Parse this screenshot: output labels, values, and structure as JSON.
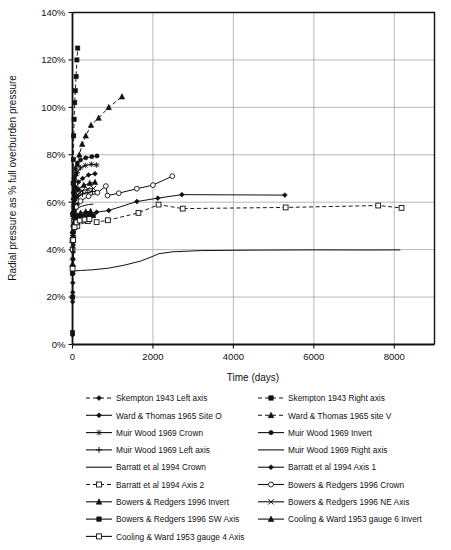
{
  "chart_data": {
    "type": "line",
    "title": "",
    "xlabel": "Time (days)",
    "ylabel": "Radial pressure as % full overburden pressure",
    "xlim": [
      0,
      9000
    ],
    "ylim": [
      0,
      1.4
    ],
    "xticks": [
      0,
      2000,
      4000,
      6000,
      8000
    ],
    "xtick_labels": [
      "0",
      "2000",
      "4000",
      "6000",
      "8000"
    ],
    "yticks": [
      0,
      0.2,
      0.4,
      0.6,
      0.8,
      1.0,
      1.2,
      1.4
    ],
    "ytick_labels": [
      "0%",
      "20%",
      "40%",
      "60%",
      "80%",
      "100%",
      "120%",
      "140%"
    ],
    "grid": "horizontal-and-vertical",
    "legend_position": "below-plot",
    "series": [
      {
        "name": "Skempton 1943 Left axis",
        "marker": "diamond",
        "linestyle": "dashed",
        "points": [
          [
            2,
            0.04
          ],
          [
            4,
            0.18
          ],
          [
            6,
            0.22
          ],
          [
            8,
            0.26
          ],
          [
            10,
            0.3
          ],
          [
            12,
            0.33
          ],
          [
            14,
            0.36
          ],
          [
            16,
            0.39
          ],
          [
            18,
            0.42
          ],
          [
            20,
            0.44
          ],
          [
            24,
            0.47
          ],
          [
            28,
            0.5
          ],
          [
            32,
            0.52
          ],
          [
            38,
            0.54
          ],
          [
            45,
            0.56
          ],
          [
            55,
            0.57
          ],
          [
            70,
            0.58
          ],
          [
            90,
            0.585
          ],
          [
            120,
            0.59
          ]
        ]
      },
      {
        "name": "Skempton 1943 Right axis",
        "marker": "square",
        "linestyle": "dashed",
        "points": [
          [
            2,
            0.05
          ],
          [
            5,
            0.2
          ],
          [
            8,
            0.4
          ],
          [
            12,
            0.55
          ],
          [
            16,
            0.68
          ],
          [
            22,
            0.78
          ],
          [
            30,
            0.88
          ],
          [
            40,
            0.95
          ],
          [
            55,
            1.02
          ],
          [
            70,
            1.07
          ],
          [
            90,
            1.13
          ],
          [
            110,
            1.2
          ],
          [
            130,
            1.25
          ]
        ]
      },
      {
        "name": "Ward & Thomas 1965 Site O",
        "marker": "diamond",
        "linestyle": "solid",
        "points": [
          [
            2,
            0.3
          ],
          [
            10,
            0.45
          ],
          [
            25,
            0.55
          ],
          [
            50,
            0.62
          ],
          [
            90,
            0.66
          ],
          [
            150,
            0.685
          ],
          [
            250,
            0.7
          ],
          [
            400,
            0.715
          ],
          [
            560,
            0.72
          ]
        ]
      },
      {
        "name": "Ward & Thomas 1965 site V",
        "marker": "triangle",
        "linestyle": "dashed",
        "points": [
          [
            3,
            0.48
          ],
          [
            10,
            0.56
          ],
          [
            25,
            0.62
          ],
          [
            50,
            0.67
          ],
          [
            80,
            0.72
          ],
          [
            120,
            0.76
          ],
          [
            170,
            0.8
          ],
          [
            240,
            0.845
          ],
          [
            330,
            0.88
          ],
          [
            460,
            0.925
          ],
          [
            650,
            0.955
          ],
          [
            900,
            1.0
          ],
          [
            1230,
            1.045
          ]
        ]
      },
      {
        "name": "Muir Wood 1969 Crown",
        "marker": "star",
        "linestyle": "solid",
        "points": [
          [
            2,
            0.36
          ],
          [
            8,
            0.5
          ],
          [
            20,
            0.58
          ],
          [
            40,
            0.64
          ],
          [
            70,
            0.69
          ],
          [
            120,
            0.725
          ],
          [
            200,
            0.745
          ],
          [
            320,
            0.755
          ],
          [
            470,
            0.76
          ],
          [
            600,
            0.757
          ]
        ]
      },
      {
        "name": "Muir Wood 1969 Invert",
        "marker": "circle",
        "linestyle": "solid",
        "points": [
          [
            2,
            0.4
          ],
          [
            8,
            0.55
          ],
          [
            20,
            0.64
          ],
          [
            40,
            0.7
          ],
          [
            70,
            0.74
          ],
          [
            120,
            0.765
          ],
          [
            200,
            0.778
          ],
          [
            330,
            0.787
          ],
          [
            480,
            0.792
          ],
          [
            610,
            0.795
          ]
        ]
      },
      {
        "name": "Muir Wood 1969 Left axis",
        "marker": "plus",
        "linestyle": "solid",
        "points": [
          [
            2,
            0.33
          ],
          [
            8,
            0.46
          ],
          [
            20,
            0.54
          ],
          [
            45,
            0.59
          ],
          [
            85,
            0.615
          ],
          [
            150,
            0.628
          ],
          [
            250,
            0.635
          ],
          [
            380,
            0.64
          ],
          [
            500,
            0.645
          ]
        ]
      },
      {
        "name": "Muir Wood 1969 Right axis",
        "marker": "none",
        "linestyle": "solid",
        "points": [
          [
            2,
            0.3
          ],
          [
            10,
            0.42
          ],
          [
            25,
            0.5
          ],
          [
            50,
            0.545
          ],
          [
            90,
            0.565
          ],
          [
            160,
            0.578
          ],
          [
            260,
            0.585
          ],
          [
            400,
            0.59
          ],
          [
            520,
            0.592
          ]
        ]
      },
      {
        "name": "Barratt et al 1994 Crown",
        "marker": "none",
        "linestyle": "solid",
        "points": [
          [
            2,
            0.31
          ],
          [
            200,
            0.312
          ],
          [
            500,
            0.315
          ],
          [
            900,
            0.322
          ],
          [
            1300,
            0.335
          ],
          [
            1700,
            0.352
          ],
          [
            2000,
            0.372
          ],
          [
            2150,
            0.383
          ],
          [
            2500,
            0.391
          ],
          [
            3200,
            0.396
          ],
          [
            4500,
            0.398
          ],
          [
            6000,
            0.399
          ],
          [
            7400,
            0.3985
          ],
          [
            8150,
            0.399
          ]
        ]
      },
      {
        "name": "Barratt et al 1994 Axis 1",
        "marker": "diamond",
        "linestyle": "solid",
        "points": [
          [
            2,
            0.47
          ],
          [
            60,
            0.53
          ],
          [
            180,
            0.545
          ],
          [
            380,
            0.552
          ],
          [
            600,
            0.558
          ],
          [
            900,
            0.565
          ],
          [
            1600,
            0.603
          ],
          [
            2120,
            0.617
          ],
          [
            2720,
            0.632
          ],
          [
            5280,
            0.63
          ]
        ]
      },
      {
        "name": "Barratt et al 1994 Axis 2",
        "marker": "open-square",
        "linestyle": "dashed",
        "points": [
          [
            2,
            0.44
          ],
          [
            120,
            0.5
          ],
          [
            380,
            0.52
          ],
          [
            600,
            0.516
          ],
          [
            880,
            0.524
          ],
          [
            1640,
            0.555
          ],
          [
            2140,
            0.59
          ],
          [
            2740,
            0.573
          ],
          [
            5300,
            0.578
          ],
          [
            7600,
            0.586
          ],
          [
            8180,
            0.576
          ]
        ]
      },
      {
        "name": "Bowers & Redgers 1996 Crown",
        "marker": "open-circle",
        "linestyle": "solid",
        "points": [
          [
            2,
            0.4
          ],
          [
            30,
            0.52
          ],
          [
            90,
            0.58
          ],
          [
            200,
            0.605
          ],
          [
            400,
            0.625
          ],
          [
            620,
            0.64
          ],
          [
            830,
            0.668
          ],
          [
            870,
            0.628
          ],
          [
            1150,
            0.638
          ],
          [
            1600,
            0.657
          ],
          [
            2000,
            0.672
          ],
          [
            2480,
            0.71
          ]
        ]
      },
      {
        "name": "Bowers & Redgers 1996 Invert",
        "marker": "triangle",
        "linestyle": "solid",
        "points": [
          [
            2,
            0.44
          ],
          [
            25,
            0.56
          ],
          [
            70,
            0.625
          ],
          [
            150,
            0.655
          ],
          [
            280,
            0.672
          ],
          [
            430,
            0.68
          ],
          [
            560,
            0.684
          ]
        ]
      },
      {
        "name": "Bowers & Redgers 1996 NE Axis",
        "marker": "x",
        "linestyle": "solid",
        "points": [
          [
            2,
            0.42
          ],
          [
            20,
            0.54
          ],
          [
            60,
            0.6
          ],
          [
            130,
            0.632
          ],
          [
            240,
            0.648
          ],
          [
            380,
            0.655
          ],
          [
            520,
            0.658
          ]
        ]
      },
      {
        "name": "Bowers & Redgers 1996 SW Axis",
        "marker": "square",
        "linestyle": "solid",
        "points": [
          [
            2,
            0.3
          ],
          [
            15,
            0.44
          ],
          [
            40,
            0.5
          ],
          [
            90,
            0.525
          ],
          [
            170,
            0.535
          ],
          [
            290,
            0.54
          ],
          [
            410,
            0.542
          ],
          [
            520,
            0.543
          ]
        ]
      },
      {
        "name": "Cooling & Ward 1953 gauge 6 Invert",
        "marker": "triangle",
        "linestyle": "solid",
        "points": [
          [
            2,
            0.34
          ],
          [
            20,
            0.46
          ],
          [
            55,
            0.52
          ],
          [
            110,
            0.545
          ],
          [
            200,
            0.555
          ],
          [
            330,
            0.56
          ],
          [
            450,
            0.562
          ]
        ]
      },
      {
        "name": "Cooling & Ward 1953 gauge 4 Axis",
        "marker": "open-square",
        "linestyle": "solid",
        "points": [
          [
            2,
            0.32
          ],
          [
            18,
            0.44
          ],
          [
            50,
            0.495
          ],
          [
            100,
            0.515
          ],
          [
            180,
            0.523
          ],
          [
            300,
            0.527
          ],
          [
            420,
            0.529
          ]
        ]
      }
    ]
  },
  "legend": {
    "entries": [
      {
        "label": "Skempton 1943 Left axis",
        "marker": "diamond",
        "linestyle": "dashed",
        "column": 0
      },
      {
        "label": "Skempton 1943 Right axis",
        "marker": "square",
        "linestyle": "dashed",
        "column": 1
      },
      {
        "label": "Ward & Thomas 1965 Site O",
        "marker": "diamond",
        "linestyle": "solid",
        "column": 0
      },
      {
        "label": "Ward & Thomas 1965 site V",
        "marker": "triangle",
        "linestyle": "dashed",
        "column": 1
      },
      {
        "label": "Muir Wood 1969 Crown",
        "marker": "star",
        "linestyle": "solid",
        "column": 0
      },
      {
        "label": "Muir Wood 1969 Invert",
        "marker": "circle",
        "linestyle": "solid",
        "column": 1
      },
      {
        "label": "Muir Wood 1969 Left axis",
        "marker": "plus",
        "linestyle": "solid",
        "column": 0
      },
      {
        "label": "Muir Wood 1969 Right axis",
        "marker": "none",
        "linestyle": "solid",
        "column": 1
      },
      {
        "label": "Barratt et al 1994 Crown",
        "marker": "none",
        "linestyle": "solid",
        "column": 0
      },
      {
        "label": "Barratt et al 1994 Axis 1",
        "marker": "diamond",
        "linestyle": "solid",
        "column": 1
      },
      {
        "label": "Barratt et al 1994 Axis 2",
        "marker": "open-square",
        "linestyle": "dashed",
        "column": 0
      },
      {
        "label": "Bowers & Redgers 1996 Crown",
        "marker": "open-circle",
        "linestyle": "solid",
        "column": 1
      },
      {
        "label": "Bowers & Redgers 1996 Invert",
        "marker": "triangle",
        "linestyle": "solid",
        "column": 0
      },
      {
        "label": "Bowers & Redgers 1996 NE Axis",
        "marker": "x",
        "linestyle": "solid",
        "column": 1
      },
      {
        "label": "Bowers & Redgers 1996 SW Axis",
        "marker": "square",
        "linestyle": "solid",
        "column": 0
      },
      {
        "label": "Cooling & Ward 1953 gauge 6 Invert",
        "marker": "triangle",
        "linestyle": "solid",
        "column": 1
      },
      {
        "label": "Cooling & Ward 1953 gauge 4 Axis",
        "marker": "open-square",
        "linestyle": "solid",
        "column": 0
      }
    ]
  },
  "colors": {
    "ink": "#111111",
    "grid": "#9a9a9a",
    "background": "#ffffff"
  }
}
